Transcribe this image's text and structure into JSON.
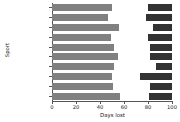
{
  "chart_data": {
    "type": "bar",
    "orientation": "horizontal",
    "stacked": true,
    "title": "",
    "xlabel": "Days lost",
    "ylabel": "Sport",
    "xlim": [
      0,
      100
    ],
    "xticks": [
      0,
      20,
      40,
      60,
      80,
      100
    ],
    "grid": false,
    "legend": null,
    "categories": [
      "Overall",
      "Boy's football",
      "Boy's soccer",
      "Girl's soccer",
      "Girl's volleyball",
      "Boy's basketball",
      "Girl's basketball",
      "Boy's wrestling",
      "Boy's baseball",
      "Girl's softball"
    ],
    "series": [
      {
        "name": "segment-1",
        "color": "#808080",
        "values": [
          50,
          47,
          56,
          49,
          52,
          55,
          52,
          50,
          51,
          57
        ]
      },
      {
        "name": "segment-2",
        "color": "#ffffff",
        "values": [
          30,
          31,
          28,
          31,
          30,
          27,
          35,
          23,
          31,
          24
        ]
      },
      {
        "name": "segment-3",
        "color": "#333333",
        "values": [
          20,
          22,
          16,
          20,
          18,
          18,
          13,
          27,
          18,
          19
        ]
      }
    ],
    "cumulative_boundaries": [
      [
        50,
        80
      ],
      [
        47,
        78
      ],
      [
        56,
        84
      ],
      [
        49,
        80
      ],
      [
        52,
        82
      ],
      [
        55,
        82
      ],
      [
        52,
        87
      ],
      [
        50,
        73
      ],
      [
        51,
        82
      ],
      [
        57,
        81
      ]
    ]
  },
  "axis": {
    "x_tick_labels": [
      "0",
      "20",
      "40",
      "60",
      "80",
      "100"
    ],
    "x_title": "Days lost",
    "y_title": "Sport"
  }
}
